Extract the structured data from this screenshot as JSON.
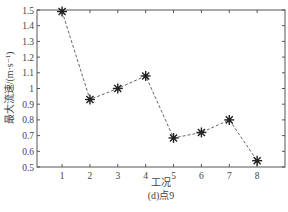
{
  "chart_data": {
    "type": "line",
    "title": "",
    "caption": "(d)点9",
    "xlabel": "工况",
    "ylabel": "最大流速/(m·s⁻¹)",
    "x": [
      1,
      2,
      3,
      4,
      5,
      6,
      7,
      8
    ],
    "xticks": [
      "1",
      "2",
      "3",
      "4",
      "5",
      "6",
      "7",
      "8"
    ],
    "yticks": [
      "0.5",
      "0.6",
      "0.7",
      "0.8",
      "0.9",
      "1",
      "1.1",
      "1.2",
      "1.3",
      "1.4",
      "1.5"
    ],
    "ylim": [
      0.5,
      1.5
    ],
    "xlim": [
      0.1,
      9.0
    ],
    "grid": false,
    "legend": null,
    "series": [
      {
        "name": "点9",
        "marker": "asterisk",
        "line_style": "dashed",
        "color": "#333333",
        "values": [
          1.49,
          0.93,
          1.0,
          1.08,
          0.685,
          0.72,
          0.8,
          0.54
        ]
      }
    ]
  }
}
